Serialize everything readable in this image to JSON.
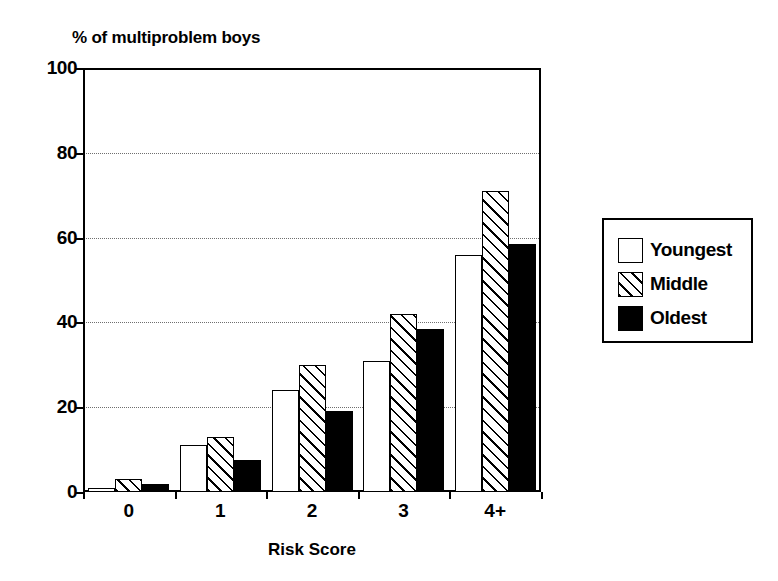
{
  "chart_data": {
    "type": "bar",
    "title": "",
    "ylabel": "% of multiproblem boys",
    "xlabel": "Risk Score",
    "categories": [
      "0",
      "1",
      "2",
      "3",
      "4+"
    ],
    "series": [
      {
        "name": "Youngest",
        "fill": "white",
        "values": [
          1,
          11,
          24,
          31,
          56
        ]
      },
      {
        "name": "Middle",
        "fill": "hatch",
        "values": [
          3,
          13,
          30,
          42,
          71
        ]
      },
      {
        "name": "Oldest",
        "fill": "black",
        "values": [
          2,
          7.5,
          19,
          38.5,
          58.5
        ]
      }
    ],
    "ylim": [
      0,
      100
    ],
    "yticks": [
      0,
      20,
      40,
      60,
      80,
      100
    ],
    "gridlines": [
      20,
      40,
      60,
      80
    ],
    "grid": true,
    "legend_position": "right-outside"
  },
  "legend": {
    "items": [
      {
        "label": "Youngest",
        "fill": "white"
      },
      {
        "label": "Middle",
        "fill": "hatch"
      },
      {
        "label": "Oldest",
        "fill": "black"
      }
    ]
  },
  "colors": {
    "axis": "#000000",
    "grid": "#6f6f6f",
    "background": "#ffffff",
    "bar_outline": "#000000",
    "oldest_fill": "#000000",
    "youngest_fill": "#ffffff"
  }
}
